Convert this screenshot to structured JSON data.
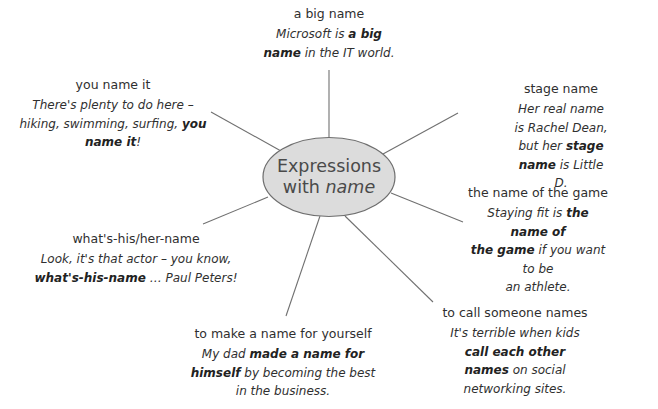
{
  "title": {
    "line1": "Expressions",
    "line2_prefix": "with ",
    "line2_italic": "name"
  },
  "colors": {
    "ellipse_fill": "#dcdcdc",
    "ellipse_stroke": "#6e6e6e",
    "line_stroke": "#707070",
    "text": "#2f2f2f"
  },
  "nodes": [
    {
      "id": "a-big-name",
      "heading": "a big name",
      "example": [
        {
          "t": "Microsoft is ",
          "b": false
        },
        {
          "t": "a big",
          "b": true
        },
        {
          "br": true
        },
        {
          "t": "name",
          "b": true
        },
        {
          "t": " in the IT world.",
          "b": false
        }
      ]
    },
    {
      "id": "you-name-it",
      "heading": "you name it",
      "example": [
        {
          "t": "There's plenty to do here –",
          "b": false
        },
        {
          "br": true
        },
        {
          "t": "hiking, swimming, surfing, ",
          "b": false
        },
        {
          "t": "you",
          "b": true
        },
        {
          "br": true
        },
        {
          "t": "name it",
          "b": true
        },
        {
          "t": "!",
          "b": false
        }
      ]
    },
    {
      "id": "stage-name",
      "heading": "stage name",
      "example": [
        {
          "t": "Her real name is Rachel Dean,",
          "b": false
        },
        {
          "br": true
        },
        {
          "t": "but her ",
          "b": false
        },
        {
          "t": "stage name",
          "b": true
        },
        {
          "t": " is Little D.",
          "b": false
        }
      ]
    },
    {
      "id": "the-name-of-the-game",
      "heading": "the name of the game",
      "example": [
        {
          "t": "Staying fit is ",
          "b": false
        },
        {
          "t": "the name of",
          "b": true
        },
        {
          "br": true
        },
        {
          "t": "the game",
          "b": true
        },
        {
          "t": " if you want to be",
          "b": false
        },
        {
          "br": true
        },
        {
          "t": "an athlete.",
          "b": false
        }
      ]
    },
    {
      "id": "whats-his-her-name",
      "heading": "what's-his/her-name",
      "example": [
        {
          "t": "Look, it's that actor – you know,",
          "b": false
        },
        {
          "br": true
        },
        {
          "t": "what's-his-name",
          "b": true
        },
        {
          "t": " … Paul Peters!",
          "b": false
        }
      ]
    },
    {
      "id": "to-call-someone-names",
      "heading": "to call someone names",
      "example": [
        {
          "t": "It's terrible when kids ",
          "b": false
        },
        {
          "t": "call each other",
          "b": true
        },
        {
          "br": true
        },
        {
          "t": "names",
          "b": true
        },
        {
          "t": " on social networking sites.",
          "b": false
        }
      ]
    },
    {
      "id": "to-make-a-name-for-yourself",
      "heading": "to make a name for yourself",
      "example": [
        {
          "t": "My dad ",
          "b": false
        },
        {
          "t": "made a name for",
          "b": true
        },
        {
          "br": true
        },
        {
          "t": "himself",
          "b": true
        },
        {
          "t": " by becoming the best",
          "b": false
        },
        {
          "br": true
        },
        {
          "t": "in the business.",
          "b": false
        }
      ]
    }
  ]
}
